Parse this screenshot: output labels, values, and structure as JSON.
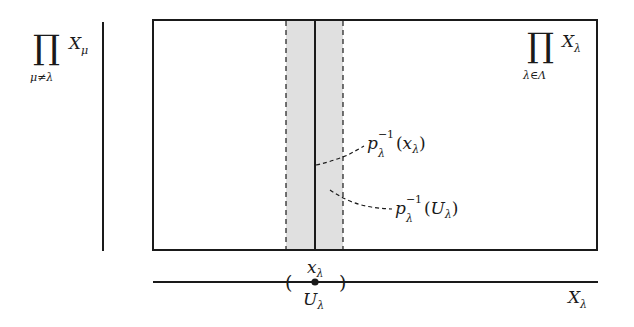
{
  "diagram": {
    "colors": {
      "line": "#1a1a1a",
      "strip_fill": "#e0e0e0",
      "background": "#ffffff"
    },
    "labels": {
      "complement_product": {
        "symbol": "∏",
        "subscript": "μ≠λ",
        "factor": "X",
        "factor_sub": "μ"
      },
      "full_product": {
        "symbol": "∏",
        "subscript": "λ∈Λ",
        "factor": "X",
        "factor_sub": "λ"
      },
      "preimage_point": {
        "p": "p",
        "p_sub": "λ",
        "p_sup": "−1",
        "arg_open": "(",
        "arg": "x",
        "arg_sub": "λ",
        "arg_close": ")"
      },
      "preimage_open": {
        "p": "p",
        "p_sub": "λ",
        "p_sup": "−1",
        "arg_open": "(",
        "arg": "U",
        "arg_sub": "λ",
        "arg_close": ")"
      },
      "point": {
        "main": "x",
        "sub": "λ"
      },
      "open_set": {
        "main": "U",
        "sub": "λ"
      },
      "axis": {
        "main": "X",
        "sub": "λ"
      },
      "interval_left": "(",
      "interval_right": ")"
    }
  }
}
